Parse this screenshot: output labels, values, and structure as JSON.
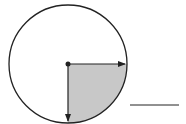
{
  "diagram": {
    "type": "circle-sector",
    "circle": {
      "cx": 68,
      "cy": 64,
      "r": 59,
      "stroke": "#222222"
    },
    "shaded_sector": {
      "fraction": 0.25,
      "fill": "#c8c8c8",
      "from_direction": "right",
      "to_direction": "down"
    },
    "radii": [
      {
        "direction": "right",
        "arrow": true
      },
      {
        "direction": "down",
        "arrow": true
      }
    ],
    "answer_blank": {
      "x1": 130,
      "x2": 179,
      "y": 105,
      "value": ""
    },
    "colors": {
      "stroke": "#222222",
      "shade": "#c8c8c8",
      "background": "#ffffff"
    }
  }
}
